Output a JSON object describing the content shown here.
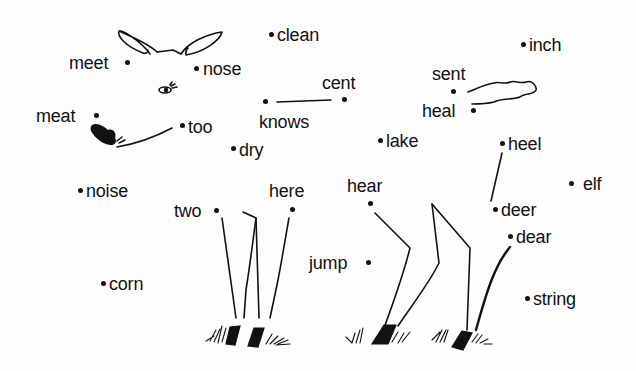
{
  "worksheet": {
    "type": "dot-to-dot",
    "subject": "deer",
    "line_color": "#111111",
    "background": "#fdfdfd",
    "words": [
      {
        "id": "clean",
        "label": "clean",
        "x": 277,
        "y": 25,
        "dot": [
          271,
          34
        ]
      },
      {
        "id": "meet",
        "label": "meet",
        "x": 69,
        "y": 53,
        "dot": [
          127,
          62
        ]
      },
      {
        "id": "nose",
        "label": "nose",
        "x": 203,
        "y": 59,
        "dot": [
          196,
          68
        ]
      },
      {
        "id": "cent",
        "label": "cent",
        "x": 322,
        "y": 73,
        "dot": [
          344,
          99
        ]
      },
      {
        "id": "knows",
        "label": "knows",
        "x": 259,
        "y": 112,
        "dot": [
          265,
          101
        ]
      },
      {
        "id": "meat",
        "label": "meat",
        "x": 36,
        "y": 106,
        "dot": [
          96,
          115
        ]
      },
      {
        "id": "too",
        "label": "too",
        "x": 188,
        "y": 117,
        "dot": [
          182,
          125
        ]
      },
      {
        "id": "dry",
        "label": "dry",
        "x": 239,
        "y": 140,
        "dot": [
          233,
          148
        ]
      },
      {
        "id": "inch",
        "label": "inch",
        "x": 529,
        "y": 35,
        "dot": [
          523,
          44
        ]
      },
      {
        "id": "sent",
        "label": "sent",
        "x": 432,
        "y": 64,
        "dot": [
          453,
          91
        ]
      },
      {
        "id": "heal",
        "label": "heal",
        "x": 422,
        "y": 101,
        "dot": [
          473,
          110
        ]
      },
      {
        "id": "lake",
        "label": "lake",
        "x": 386,
        "y": 131,
        "dot": [
          380,
          140
        ]
      },
      {
        "id": "heel",
        "label": "heel",
        "x": 508,
        "y": 134,
        "dot": [
          502,
          143
        ]
      },
      {
        "id": "elf",
        "label": "elf",
        "x": 583,
        "y": 174,
        "dot": [
          571,
          183
        ]
      },
      {
        "id": "noise",
        "label": "noise",
        "x": 86,
        "y": 181,
        "dot": [
          80,
          190
        ]
      },
      {
        "id": "here",
        "label": "here",
        "x": 269,
        "y": 181,
        "dot": [
          292,
          209
        ]
      },
      {
        "id": "hear",
        "label": "hear",
        "x": 347,
        "y": 176,
        "dot": [
          370,
          203
        ]
      },
      {
        "id": "two",
        "label": "two",
        "x": 174,
        "y": 201,
        "dot": [
          216,
          210
        ]
      },
      {
        "id": "deer",
        "label": "deer",
        "x": 501,
        "y": 200,
        "dot": [
          495,
          209
        ]
      },
      {
        "id": "dear",
        "label": "dear",
        "x": 516,
        "y": 227,
        "dot": [
          510,
          236
        ]
      },
      {
        "id": "jump",
        "label": "jump",
        "x": 309,
        "y": 253,
        "dot": [
          368,
          262
        ]
      },
      {
        "id": "corn",
        "label": "corn",
        "x": 109,
        "y": 274,
        "dot": [
          103,
          283
        ]
      },
      {
        "id": "string",
        "label": "string",
        "x": 533,
        "y": 289,
        "dot": [
          527,
          298
        ]
      }
    ]
  }
}
